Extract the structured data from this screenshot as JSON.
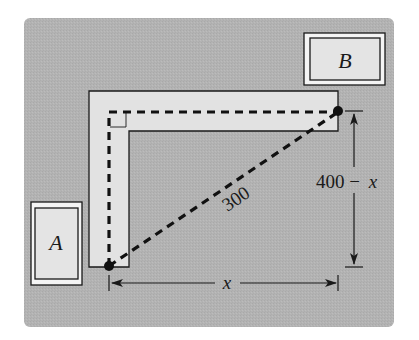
{
  "diagram": {
    "type": "geometry-word-problem",
    "colors": {
      "page_background": "#ffffff",
      "panel_background": "#b3b3b3",
      "corridor_fill": "#e2e2e2",
      "box_fill": "#e4e4e4",
      "stroke": "#1a1a1a"
    },
    "nodes": {
      "A": {
        "label": "A",
        "description": "Box A at lower left"
      },
      "B": {
        "label": "B",
        "description": "Box B at upper right"
      }
    },
    "edges": [
      {
        "from": "A",
        "to": "B",
        "style": "dashed",
        "path": "along L-shaped corridor (up then right)"
      },
      {
        "from": "A",
        "to": "B",
        "style": "dashed",
        "path": "straight diagonal",
        "label": "300"
      }
    ],
    "dimensions": {
      "horizontal": {
        "label": "x",
        "description": "horizontal leg from A's column to B's column"
      },
      "vertical": {
        "label_number": "400",
        "label_minus": "−",
        "label_var": "x",
        "description": "vertical leg from B's row down to A's row"
      }
    },
    "labels": {
      "box_a": "A",
      "box_b": "B",
      "diagonal": "300",
      "horizontal_dim": "x",
      "vertical_dim_number": "400 −",
      "vertical_dim_var": "x"
    }
  }
}
